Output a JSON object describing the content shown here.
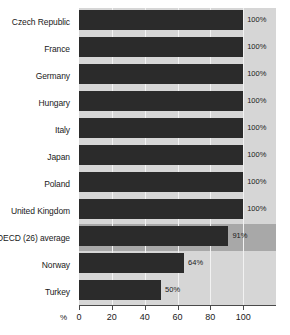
{
  "chart_data": {
    "type": "bar",
    "orientation": "horizontal",
    "title": "",
    "xlabel": "%",
    "ylabel": "",
    "xlim": [
      0,
      120
    ],
    "grid": true,
    "legend": null,
    "xticks": [
      0,
      20,
      40,
      60,
      80,
      100
    ],
    "xtick_labels": [
      "0",
      "20",
      "40",
      "60",
      "80",
      "100"
    ],
    "categories": [
      "Czech Republic",
      "France",
      "Germany",
      "Hungary",
      "Italy",
      "Japan",
      "Poland",
      "United Kingdom",
      "OECD (26) average",
      "Norway",
      "Turkey"
    ],
    "values": [
      100,
      100,
      100,
      100,
      100,
      100,
      100,
      100,
      91,
      64,
      50
    ],
    "value_labels": [
      "100%",
      "100%",
      "100%",
      "100%",
      "100%",
      "100%",
      "100%",
      "100%",
      "91%",
      "64%",
      "50%"
    ],
    "highlight_category": "OECD (26) average",
    "colors": {
      "bar": "#2b2b2b",
      "plot_background": "#d6d6d6",
      "highlight_row_background": "#a8a8a8",
      "gridline": "#f2f2f2",
      "axis": "#4a4a4a",
      "text": "#1a1a1a",
      "page_background": "#ffffff"
    }
  }
}
